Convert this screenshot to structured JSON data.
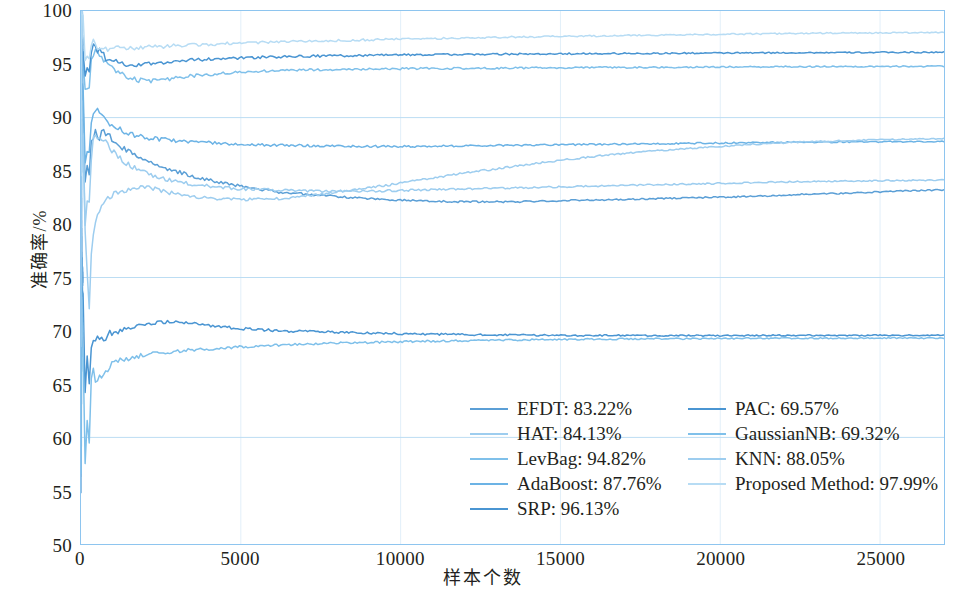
{
  "chart_data": {
    "type": "line",
    "title": "",
    "xlabel": "样本个数",
    "ylabel": "准确率/%",
    "xlim": [
      0,
      27000
    ],
    "ylim": [
      50,
      100
    ],
    "xticks": [
      0,
      5000,
      10000,
      15000,
      20000,
      25000
    ],
    "yticks": [
      50,
      55,
      60,
      65,
      70,
      75,
      80,
      85,
      90,
      95,
      100
    ],
    "grid": true,
    "grid_major_y": [
      60,
      75,
      90
    ],
    "legend_position": "lower-right-inside",
    "series": [
      {
        "name": "EFDT",
        "legend": "EFDT: 83.22%",
        "final": 83.22,
        "color": "#5b9fd6",
        "x": [
          60,
          110,
          160,
          210,
          260,
          310,
          380,
          460,
          560,
          700,
          900,
          1200,
          1600,
          2100,
          2700,
          3400,
          4200,
          5100,
          6200,
          7500,
          9000,
          10500,
          12000,
          13500,
          15000,
          16500,
          18000,
          19500,
          21000,
          22500,
          24000,
          25500,
          27000
        ],
        "values": [
          92.0,
          86.5,
          79.0,
          88.0,
          84.5,
          87.5,
          88.4,
          88.6,
          88.0,
          88.7,
          88.2,
          87.4,
          86.6,
          85.9,
          85.2,
          84.6,
          84.0,
          83.5,
          83.0,
          82.7,
          82.4,
          82.2,
          82.1,
          82.1,
          82.2,
          82.3,
          82.4,
          82.5,
          82.6,
          82.8,
          82.9,
          83.1,
          83.22
        ]
      },
      {
        "name": "HAT",
        "legend": "HAT: 84.13%",
        "final": 84.13,
        "color": "#9dcdef",
        "x": [
          60,
          110,
          160,
          210,
          260,
          310,
          380,
          460,
          560,
          700,
          900,
          1200,
          1600,
          2100,
          2700,
          3400,
          4200,
          5100,
          6200,
          7500,
          9000,
          10500,
          12000,
          13500,
          15000,
          16500,
          18000,
          19500,
          21000,
          22500,
          24000,
          25500,
          27000
        ],
        "values": [
          90.0,
          83.0,
          76.0,
          86.0,
          82.0,
          86.0,
          88.3,
          88.4,
          87.8,
          88.0,
          87.2,
          86.2,
          85.4,
          84.7,
          84.2,
          83.8,
          83.5,
          83.3,
          83.2,
          83.1,
          83.1,
          83.2,
          83.3,
          83.4,
          83.5,
          83.6,
          83.7,
          83.8,
          83.9,
          84.0,
          84.05,
          84.1,
          84.13
        ]
      },
      {
        "name": "LevBag",
        "legend": "LevBag: 94.82%",
        "final": 94.82,
        "color": "#7fc0ea",
        "x": [
          60,
          110,
          160,
          210,
          260,
          310,
          380,
          460,
          560,
          700,
          900,
          1200,
          1600,
          2100,
          2700,
          3400,
          4200,
          5100,
          6200,
          7500,
          9000,
          10500,
          12000,
          13500,
          15000,
          16500,
          18000,
          19500,
          21000,
          22500,
          24000,
          25500,
          27000
        ],
        "values": [
          96.0,
          93.5,
          90.0,
          94.0,
          93.0,
          95.2,
          96.0,
          96.2,
          95.8,
          95.4,
          94.8,
          94.2,
          93.6,
          93.4,
          93.6,
          93.9,
          94.1,
          94.3,
          94.4,
          94.5,
          94.55,
          94.6,
          94.62,
          94.65,
          94.68,
          94.7,
          94.72,
          94.74,
          94.76,
          94.78,
          94.79,
          94.8,
          94.82
        ]
      },
      {
        "name": "AdaBoost",
        "legend": "AdaBoost: 87.76%",
        "final": 87.76,
        "color": "#6cb3e5",
        "x": [
          60,
          110,
          160,
          210,
          260,
          310,
          380,
          460,
          560,
          700,
          900,
          1200,
          1600,
          2100,
          2700,
          3400,
          4200,
          5100,
          6200,
          7500,
          9000,
          10500,
          12000,
          13500,
          15000,
          16500,
          18000,
          19500,
          21000,
          22500,
          24000,
          25500,
          27000
        ],
        "values": [
          94.0,
          88.0,
          82.0,
          90.0,
          86.5,
          89.5,
          90.5,
          90.8,
          90.3,
          90.0,
          89.4,
          88.9,
          88.4,
          88.1,
          87.9,
          87.75,
          87.6,
          87.5,
          87.4,
          87.35,
          87.3,
          87.3,
          87.35,
          87.4,
          87.45,
          87.5,
          87.55,
          87.6,
          87.65,
          87.7,
          87.72,
          87.74,
          87.76
        ]
      },
      {
        "name": "SRP",
        "legend": "SRP: 96.13%",
        "final": 96.13,
        "color": "#4a95d2",
        "x": [
          60,
          110,
          160,
          210,
          260,
          310,
          380,
          460,
          560,
          700,
          900,
          1200,
          1600,
          2100,
          2700,
          3400,
          4200,
          5100,
          6200,
          7500,
          9000,
          10500,
          12000,
          13500,
          15000,
          16500,
          18000,
          19500,
          21000,
          22500,
          24000,
          25500,
          27000
        ],
        "values": [
          97.0,
          95.0,
          92.0,
          95.5,
          94.5,
          96.2,
          96.6,
          96.5,
          96.2,
          95.8,
          95.4,
          95.1,
          94.9,
          95.0,
          95.2,
          95.4,
          95.5,
          95.6,
          95.7,
          95.78,
          95.84,
          95.89,
          95.93,
          95.96,
          95.99,
          96.01,
          96.03,
          96.05,
          96.07,
          96.09,
          96.1,
          96.12,
          96.13
        ]
      },
      {
        "name": "PAC",
        "legend": "PAC: 69.57%",
        "final": 69.57,
        "color": "#4a95d2",
        "x": [
          60,
          110,
          160,
          210,
          260,
          310,
          380,
          460,
          560,
          700,
          900,
          1200,
          1600,
          2100,
          2700,
          3400,
          4200,
          5100,
          6200,
          7500,
          9000,
          10500,
          12000,
          13500,
          15000,
          16500,
          18000,
          19500,
          21000,
          22500,
          24000,
          25500,
          27000
        ],
        "values": [
          75.0,
          66.0,
          62.0,
          70.0,
          65.0,
          68.5,
          69.5,
          68.8,
          69.5,
          69.2,
          69.8,
          70.0,
          70.3,
          70.6,
          70.9,
          70.7,
          70.4,
          70.2,
          70.0,
          69.9,
          69.8,
          69.7,
          69.65,
          69.6,
          69.58,
          69.56,
          69.55,
          69.55,
          69.56,
          69.57,
          69.57,
          69.57,
          69.57
        ]
      },
      {
        "name": "GaussianNB",
        "legend": "GaussianNB: 69.32%",
        "final": 69.32,
        "color": "#7fc0ea",
        "x": [
          60,
          110,
          160,
          210,
          260,
          310,
          380,
          460,
          560,
          700,
          900,
          1200,
          1600,
          2100,
          2700,
          3400,
          4200,
          5100,
          6200,
          7500,
          9000,
          10500,
          12000,
          13500,
          15000,
          16500,
          18000,
          19500,
          21000,
          22500,
          24000,
          25500,
          27000
        ],
        "values": [
          70.0,
          60.0,
          55.0,
          64.0,
          59.5,
          65.0,
          66.2,
          65.0,
          66.0,
          65.5,
          66.8,
          67.2,
          67.5,
          67.8,
          68.0,
          68.2,
          68.35,
          68.5,
          68.65,
          68.8,
          68.9,
          69.0,
          69.08,
          69.14,
          69.19,
          69.22,
          69.25,
          69.27,
          69.29,
          69.3,
          69.31,
          69.32,
          69.32
        ]
      },
      {
        "name": "KNN",
        "legend": "KNN: 88.05%",
        "final": 88.05,
        "color": "#9dcdef",
        "x": [
          60,
          110,
          160,
          210,
          260,
          310,
          380,
          460,
          560,
          700,
          900,
          1200,
          1600,
          2100,
          2700,
          3400,
          4200,
          5100,
          6200,
          7500,
          9000,
          10500,
          12000,
          13500,
          15000,
          16500,
          18000,
          19500,
          21000,
          22500,
          24000,
          25500,
          27000
        ],
        "values": [
          88.0,
          82.0,
          74.0,
          76.0,
          72.0,
          76.5,
          78.5,
          80.0,
          81.2,
          82.0,
          82.6,
          83.0,
          83.3,
          83.5,
          83.0,
          82.6,
          82.4,
          82.3,
          82.4,
          82.8,
          83.4,
          84.1,
          84.8,
          85.4,
          86.0,
          86.5,
          86.9,
          87.2,
          87.5,
          87.7,
          87.85,
          87.95,
          88.05
        ]
      },
      {
        "name": "Proposed Method",
        "legend": "Proposed Method: 97.99%",
        "final": 97.99,
        "color": "#b7dcf4",
        "x": [
          60,
          110,
          160,
          210,
          260,
          310,
          380,
          460,
          560,
          700,
          900,
          1200,
          1600,
          2100,
          2700,
          3400,
          4200,
          5100,
          6200,
          7500,
          9000,
          10500,
          12000,
          13500,
          15000,
          16500,
          18000,
          19500,
          21000,
          22500,
          24000,
          25500,
          27000
        ],
        "values": [
          99.0,
          97.0,
          94.5,
          96.5,
          95.5,
          96.8,
          97.0,
          96.9,
          96.7,
          96.6,
          96.5,
          96.45,
          96.5,
          96.6,
          96.7,
          96.8,
          96.9,
          97.0,
          97.1,
          97.2,
          97.3,
          97.4,
          97.48,
          97.55,
          97.62,
          97.68,
          97.74,
          97.8,
          97.85,
          97.9,
          97.93,
          97.96,
          97.99
        ]
      }
    ]
  },
  "axes": {
    "y_title": "准确率/%",
    "x_title": "样本个数",
    "y_tick_labels": [
      "100",
      "95",
      "90",
      "85",
      "80",
      "75",
      "70",
      "65",
      "60",
      "55",
      "50"
    ],
    "x_tick_labels": [
      "0",
      "5000",
      "10000",
      "15000",
      "20000",
      "25000"
    ]
  },
  "colors": {
    "axis": "#8ec5ef",
    "grid_major": "#bcddf3",
    "grid_minor": "#e2eff9",
    "text": "#231f20"
  }
}
